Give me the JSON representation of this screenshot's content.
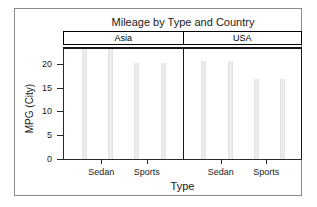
{
  "chart_data": {
    "type": "bar",
    "title": "Mileage by Type and Country",
    "xlabel": "Type",
    "ylabel": "MPG (City)",
    "ylim": [
      0,
      23.5
    ],
    "yticks": [
      0,
      5,
      10,
      15,
      20
    ],
    "ytick_labels": [
      "0",
      "5",
      "10",
      "15",
      "20"
    ],
    "grid": false,
    "legend": "none",
    "panel_variable": "Country",
    "panels": [
      {
        "label": "Asia",
        "categories": [
          "Sedan",
          "Sports"
        ],
        "bar_labels": [
          "Sedan",
          "Sedan",
          "Sports",
          "Sports"
        ],
        "values": [
          23.0,
          23.0,
          20.2,
          20.2
        ],
        "xtick_labels": [
          "Sedan",
          "Sports"
        ]
      },
      {
        "label": "USA",
        "categories": [
          "Sedan",
          "Sports"
        ],
        "bar_labels": [
          "Sedan",
          "Sedan",
          "Sports",
          "Sports"
        ],
        "values": [
          20.5,
          20.5,
          16.8,
          16.8
        ],
        "xtick_labels": [
          "Sedan",
          "Sports"
        ]
      }
    ],
    "bar_color": "#ededed",
    "axis_color": "#2b2b2b",
    "frame_color": "#8b8b8b",
    "background": "#ffffff"
  }
}
